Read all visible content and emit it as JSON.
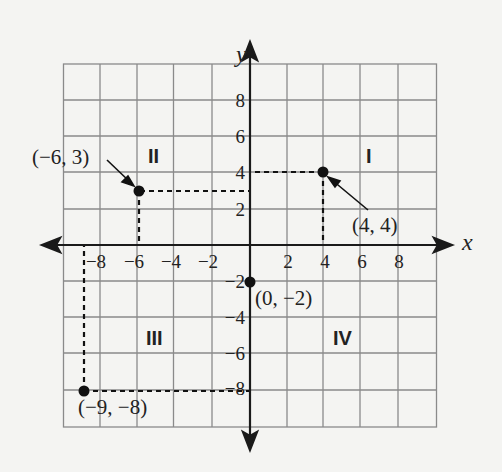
{
  "diagram": {
    "type": "coordinate-plane",
    "axes": {
      "x_label": "x",
      "y_label": "y",
      "x_ticks": [
        {
          "value": -8,
          "label": "−8"
        },
        {
          "value": -6,
          "label": "−6"
        },
        {
          "value": -4,
          "label": "−4"
        },
        {
          "value": -2,
          "label": "−2"
        },
        {
          "value": 2,
          "label": "2"
        },
        {
          "value": 4,
          "label": "4"
        },
        {
          "value": 6,
          "label": "6"
        },
        {
          "value": 8,
          "label": "8"
        }
      ],
      "y_ticks": [
        {
          "value": 8,
          "label": "8"
        },
        {
          "value": 6,
          "label": "6"
        },
        {
          "value": 4,
          "label": "4"
        },
        {
          "value": 2,
          "label": "2"
        },
        {
          "value": -2,
          "label": "−2"
        },
        {
          "value": -4,
          "label": "−4"
        },
        {
          "value": -6,
          "label": "−6"
        },
        {
          "value": -8,
          "label": "−8"
        }
      ],
      "range": {
        "x": [
          -10,
          10
        ],
        "y": [
          -10,
          10
        ]
      },
      "grid_step": 2
    },
    "quadrants": [
      {
        "id": "q1",
        "label": "I"
      },
      {
        "id": "q2",
        "label": "II"
      },
      {
        "id": "q3",
        "label": "III"
      },
      {
        "id": "q4",
        "label": "IV"
      }
    ],
    "points": [
      {
        "id": "p1",
        "x": 4,
        "y": 4,
        "label": "(4, 4)"
      },
      {
        "id": "p2",
        "x": -6,
        "y": 3,
        "label": "(−6, 3)"
      },
      {
        "id": "p3",
        "x": 0,
        "y": -2,
        "label": "(0, −2)"
      },
      {
        "id": "p4",
        "x": -9,
        "y": -8,
        "label": "(−9, −8)"
      }
    ],
    "colors": {
      "background": "#f4f4f2",
      "grid": "#8a8a8a",
      "axis": "#1a1a1a",
      "point": "#111111"
    }
  }
}
